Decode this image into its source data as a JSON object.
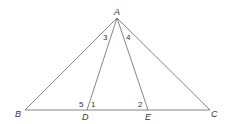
{
  "diagram": {
    "type": "geometry-triangle",
    "points": {
      "A": {
        "label": "A",
        "x": 117,
        "y": 18
      },
      "B": {
        "label": "B",
        "x": 25,
        "y": 110
      },
      "C": {
        "label": "C",
        "x": 210,
        "y": 110
      },
      "D": {
        "label": "D",
        "x": 87,
        "y": 110
      },
      "E": {
        "label": "E",
        "x": 148,
        "y": 110
      }
    },
    "segments": [
      [
        "A",
        "B"
      ],
      [
        "A",
        "C"
      ],
      [
        "B",
        "C"
      ],
      [
        "A",
        "D"
      ],
      [
        "A",
        "E"
      ]
    ],
    "angles": [
      {
        "label": "1",
        "at": "D"
      },
      {
        "label": "2",
        "at": "E"
      },
      {
        "label": "3",
        "at": "A"
      },
      {
        "label": "4",
        "at": "A"
      },
      {
        "label": "5",
        "at": "D"
      }
    ],
    "colors": {
      "stroke": "#666666",
      "text": "#333333"
    }
  }
}
